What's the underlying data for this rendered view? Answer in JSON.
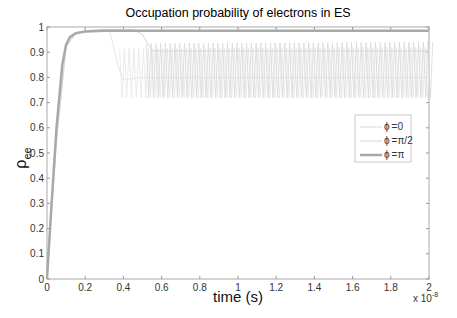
{
  "chart_data": {
    "type": "line",
    "title": "Occupation probability of electrons in ES",
    "xlabel": "time (s)",
    "ylabel": "ρ_ee",
    "ylabel_main": "ρ",
    "ylabel_sub": "ee",
    "x_multiplier": "x 10",
    "x_multiplier_exp": "-8",
    "xlim": [
      0,
      2
    ],
    "ylim": [
      0,
      1
    ],
    "xticks": [
      "0",
      "0.2",
      "0.4",
      "0.6",
      "0.8",
      "1",
      "1.2",
      "1.4",
      "1.6",
      "1.8",
      "2"
    ],
    "yticks": [
      "0",
      "0.1",
      "0.2",
      "0.3",
      "0.4",
      "0.5",
      "0.6",
      "0.7",
      "0.8",
      "0.9",
      "1"
    ],
    "grid": false,
    "legend_position": "right-center inside",
    "series": [
      {
        "name": "φ =0",
        "label_phi": "ϕ",
        "label_val": "=0",
        "color": "#d8d8d8",
        "width": 1,
        "description": "Saturates near 0.99 until t≈0.5e-8, then drops and oscillates between ~0.72 and ~0.94 with a mean trace near 0.905",
        "x": [
          0,
          0.05,
          0.1,
          0.15,
          0.2,
          0.3,
          0.45,
          0.5,
          0.55,
          0.6,
          0.8,
          1.0,
          1.2,
          1.4,
          1.6,
          1.8,
          2.0
        ],
        "y": [
          0,
          0.55,
          0.92,
          0.975,
          0.985,
          0.99,
          0.99,
          0.97,
          0.905,
          0.905,
          0.905,
          0.905,
          0.905,
          0.905,
          0.905,
          0.905,
          0.905
        ],
        "osc_min": 0.72,
        "osc_max": 0.94
      },
      {
        "name": "φ =π/2",
        "label_phi": "ϕ",
        "label_val": "=π/2",
        "color": "#e6e6e6",
        "width": 1,
        "description": "Saturates near 0.99 until t≈0.33e-8, drops to ~0.78 at t≈0.4e-8, then oscillates between ~0.72 and ~0.92",
        "x": [
          0,
          0.05,
          0.1,
          0.15,
          0.2,
          0.3,
          0.33,
          0.37,
          0.4,
          0.5,
          0.8,
          1.2,
          1.6,
          2.0
        ],
        "y": [
          0,
          0.55,
          0.92,
          0.975,
          0.985,
          0.99,
          0.98,
          0.85,
          0.79,
          0.8,
          0.8,
          0.8,
          0.8,
          0.8
        ],
        "osc_min": 0.72,
        "osc_max": 0.92
      },
      {
        "name": "φ =π",
        "label_phi": "ϕ",
        "label_val": "=π",
        "color": "#a9a9a9",
        "width": 2.5,
        "description": "Rises from 0 to ~0.98 by t≈0.15e-8 and stays flat at ~0.985",
        "x": [
          0,
          0.02,
          0.05,
          0.08,
          0.1,
          0.12,
          0.15,
          0.2,
          0.3,
          0.5,
          1.0,
          1.5,
          2.0
        ],
        "y": [
          0,
          0.25,
          0.6,
          0.85,
          0.93,
          0.96,
          0.975,
          0.982,
          0.985,
          0.985,
          0.985,
          0.985,
          0.985
        ]
      }
    ]
  }
}
